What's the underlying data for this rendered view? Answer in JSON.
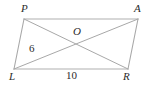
{
  "figure": {
    "kind": "parallelogram-with-diagonals",
    "background_color": "#ffffff",
    "stroke_color": "#a8a8a8",
    "text_color": "#2b2b2b",
    "vertices": [
      {
        "name": "P",
        "label": "P",
        "x": 24,
        "y": 19
      },
      {
        "name": "A",
        "label": "A",
        "x": 138,
        "y": 19
      },
      {
        "name": "R",
        "label": "R",
        "x": 128,
        "y": 69
      },
      {
        "name": "L",
        "label": "L",
        "x": 14,
        "y": 69
      }
    ],
    "intersection": {
      "name": "O",
      "label": "O",
      "x": 76,
      "y": 44
    },
    "sides": [
      {
        "name": "PA",
        "from": "P",
        "to": "A"
      },
      {
        "name": "AR",
        "from": "A",
        "to": "R"
      },
      {
        "name": "RL",
        "from": "R",
        "to": "L"
      },
      {
        "name": "LP",
        "from": "L",
        "to": "P"
      }
    ],
    "diagonals": [
      {
        "name": "PR",
        "from": "P",
        "to": "R"
      },
      {
        "name": "LA",
        "from": "L",
        "to": "A"
      }
    ],
    "measures": [
      {
        "name": "diagonal-segment-LO",
        "value": "6",
        "segment": "LO"
      },
      {
        "name": "side-LR",
        "value": "10",
        "segment": "LR"
      }
    ]
  }
}
